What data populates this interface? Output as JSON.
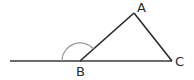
{
  "diagram": {
    "type": "geometry-triangle",
    "points": {
      "A": {
        "label": "A",
        "x": 134,
        "y": 13
      },
      "B": {
        "label": "B",
        "x": 80,
        "y": 61
      },
      "C": {
        "label": "C",
        "x": 172,
        "y": 61
      }
    },
    "extension_start": {
      "x": 10,
      "y": 61
    },
    "exterior_angle_arc": {
      "vertex": "B",
      "radius": 18,
      "color": "#9a9a9a"
    },
    "colors": {
      "line": "#2a2a2a",
      "arc": "#9a9a9a",
      "label": "#2a2a2a"
    }
  }
}
